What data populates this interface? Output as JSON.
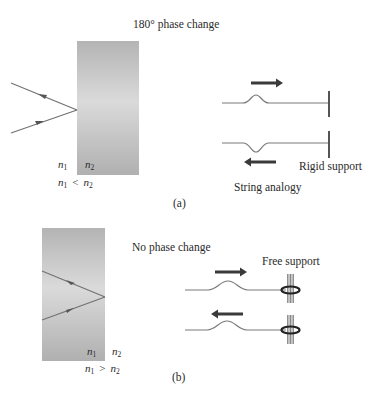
{
  "panel_a": {
    "title": "180° phase change",
    "n1": "n",
    "n1_sub": "1",
    "n2": "n",
    "n2_sub": "2",
    "relation_op": "<",
    "string_analogy_label": "String analogy",
    "support_label": "Rigid support",
    "caption": "(a)"
  },
  "panel_b": {
    "title": "No phase change",
    "n1": "n",
    "n1_sub": "1",
    "n2": "n",
    "n2_sub": "2",
    "relation_op": ">",
    "support_label": "Free support",
    "caption": "(b)"
  },
  "colors": {
    "slab_dark": "#b3b3b3",
    "slab_light": "#dcdcdc",
    "ray": "#707070",
    "string": "#7a7a7a",
    "arrow": "#3a3a3a",
    "support": "#555555",
    "ring": "#222222",
    "text": "#2a2a2a"
  }
}
